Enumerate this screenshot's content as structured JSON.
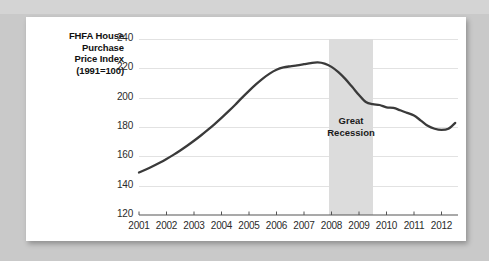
{
  "chart_data": {
    "type": "line",
    "title": "",
    "ylabel": "FHFA House Purchase Price Index (1991=100)",
    "ylabel_lines": [
      "FHFA House",
      "Purchase",
      "Price Index",
      "(1991=100)"
    ],
    "xlabel": "",
    "ylim": [
      120,
      240
    ],
    "xlim": [
      2001,
      2012.6
    ],
    "yticks": [
      240,
      220,
      200,
      180,
      160,
      140,
      120
    ],
    "xticks": [
      2001,
      2002,
      2003,
      2004,
      2005,
      2006,
      2007,
      2008,
      2009,
      2010,
      2011,
      2012
    ],
    "grid": "horizontal",
    "legend": "none",
    "line_color": "#3a3a3a",
    "annotations": [
      {
        "name": "great-recession-band",
        "label": "Great Recession",
        "label_lines": [
          "Great",
          "Recession"
        ],
        "x_start": 2007.92,
        "x_end": 2009.5,
        "color": "#dcdcdc"
      }
    ],
    "x": [
      2001.0,
      2001.25,
      2001.5,
      2001.75,
      2002.0,
      2002.25,
      2002.5,
      2002.75,
      2003.0,
      2003.25,
      2003.5,
      2003.75,
      2004.0,
      2004.25,
      2004.5,
      2004.75,
      2005.0,
      2005.25,
      2005.5,
      2005.75,
      2006.0,
      2006.25,
      2006.5,
      2006.75,
      2007.0,
      2007.25,
      2007.5,
      2007.75,
      2008.0,
      2008.25,
      2008.5,
      2008.75,
      2009.0,
      2009.25,
      2009.5,
      2009.75,
      2010.0,
      2010.25,
      2010.5,
      2010.75,
      2011.0,
      2011.25,
      2011.5,
      2011.75,
      2012.0,
      2012.25,
      2012.5
    ],
    "values": [
      149.0,
      151.0,
      153.2,
      155.6,
      158.2,
      161.0,
      164.0,
      167.2,
      170.6,
      174.2,
      178.0,
      182.0,
      186.2,
      190.6,
      195.2,
      200.0,
      204.6,
      209.0,
      213.0,
      216.4,
      219.0,
      220.6,
      221.4,
      222.0,
      222.8,
      223.6,
      224.0,
      223.2,
      221.0,
      217.4,
      212.8,
      207.4,
      201.8,
      197.0,
      195.6,
      195.0,
      193.4,
      193.0,
      191.4,
      189.6,
      187.8,
      184.4,
      180.8,
      178.8,
      178.0,
      178.8,
      182.8
    ],
    "series": [
      {
        "name": "FHFA House Purchase Price Index (1991=100)",
        "values": [
          149.0,
          151.0,
          153.2,
          155.6,
          158.2,
          161.0,
          164.0,
          167.2,
          170.6,
          174.2,
          178.0,
          182.0,
          186.2,
          190.6,
          195.2,
          200.0,
          204.6,
          209.0,
          213.0,
          216.4,
          219.0,
          220.6,
          221.4,
          222.0,
          222.8,
          223.6,
          224.0,
          223.2,
          221.0,
          217.4,
          212.8,
          207.4,
          201.8,
          197.0,
          195.6,
          195.0,
          193.4,
          193.0,
          191.4,
          189.6,
          187.8,
          184.4,
          180.8,
          178.8,
          178.0,
          178.8,
          182.8
        ]
      }
    ]
  }
}
